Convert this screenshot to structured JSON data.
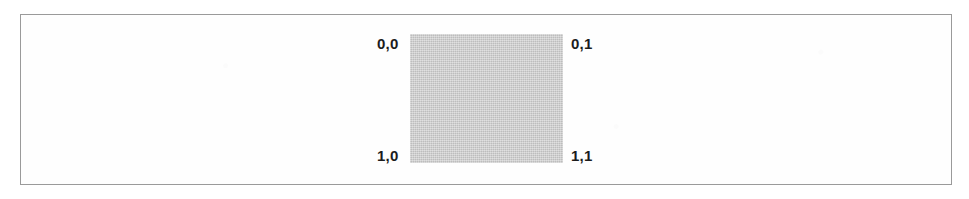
{
  "figure": {
    "kind": "coordinate-grid-diagram",
    "frame": {
      "border_color": "#9a9a9a",
      "background_color": "#fefefe"
    },
    "square": {
      "fill_color": "#c9c9c9",
      "label": "gray-unit-square"
    },
    "corner_labels": [
      {
        "id": "top-left",
        "text": "0,0",
        "row": 0,
        "col": 0
      },
      {
        "id": "top-right",
        "text": "0,1",
        "row": 0,
        "col": 1
      },
      {
        "id": "bottom-left",
        "text": "1,0",
        "row": 1,
        "col": 0
      },
      {
        "id": "bottom-right",
        "text": "1,1",
        "row": 1,
        "col": 1
      }
    ],
    "text_color": "#1c1c1c"
  }
}
